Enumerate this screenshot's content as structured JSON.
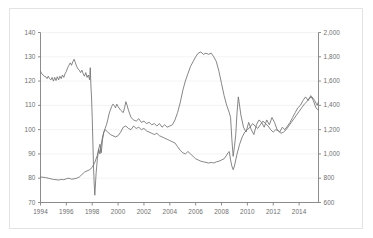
{
  "chart_data": {
    "type": "line",
    "title": "",
    "subtitle": "",
    "xlabel": "",
    "ylabel": "",
    "y2label": "",
    "grid": "horizontal",
    "legend": "none",
    "xlim": [
      1994.0,
      2015.5
    ],
    "ylim": [
      70,
      140
    ],
    "y2lim": [
      600,
      2000
    ],
    "x_tick_labels": [
      "1994",
      "1996",
      "1998",
      "2000",
      "2002",
      "2004",
      "2006",
      "2008",
      "2010",
      "2012",
      "2014"
    ],
    "x_tick_values": [
      1994,
      1996,
      1998,
      2000,
      2002,
      2004,
      2006,
      2008,
      2010,
      2012,
      2014
    ],
    "y_tick_labels": [
      "70",
      "80",
      "90",
      "100",
      "110",
      "120",
      "130",
      "140"
    ],
    "y_tick_values": [
      70,
      80,
      90,
      100,
      110,
      120,
      130,
      140
    ],
    "y2_tick_labels": [
      "600",
      "800",
      "1,000",
      "1,200",
      "1,400",
      "1,600",
      "1,800",
      "2,000"
    ],
    "y2_tick_values": [
      600,
      800,
      1000,
      1200,
      1400,
      1600,
      1800,
      2000
    ],
    "series": [
      {
        "name": "series-left-axis",
        "axis": "left",
        "color": "#707070",
        "x": [
          1994.0,
          1994.1,
          1994.2,
          1994.3,
          1994.4,
          1994.5,
          1994.6,
          1994.7,
          1994.8,
          1994.9,
          1995.0,
          1995.1,
          1995.2,
          1995.3,
          1995.4,
          1995.5,
          1995.6,
          1995.7,
          1995.8,
          1995.9,
          1996.0,
          1996.1,
          1996.2,
          1996.3,
          1996.4,
          1996.5,
          1996.6,
          1996.7,
          1996.8,
          1996.9,
          1997.0,
          1997.1,
          1997.2,
          1997.3,
          1997.4,
          1997.5,
          1997.6,
          1997.7,
          1997.8,
          1997.85,
          1997.9,
          1997.95,
          1998.0,
          1998.05,
          1998.1,
          1998.15,
          1998.2,
          1998.3,
          1998.4,
          1998.5,
          1998.6,
          1998.7,
          1998.8,
          1998.9,
          1999.0,
          1999.1,
          1999.2,
          1999.3,
          1999.4,
          1999.5,
          1999.6,
          1999.7,
          1999.8,
          1999.9,
          2000.0,
          2000.2,
          2000.4,
          2000.5,
          2000.6,
          2000.7,
          2000.8,
          2000.9,
          2001.0,
          2001.2,
          2001.4,
          2001.6,
          2001.8,
          2002.0,
          2002.2,
          2002.4,
          2002.6,
          2002.8,
          2003.0,
          2003.2,
          2003.4,
          2003.6,
          2003.8,
          2004.0,
          2004.2,
          2004.4,
          2004.6,
          2004.8,
          2005.0,
          2005.2,
          2005.4,
          2005.6,
          2005.8,
          2006.0,
          2006.2,
          2006.4,
          2006.6,
          2006.8,
          2007.0,
          2007.2,
          2007.4,
          2007.6,
          2007.8,
          2008.0,
          2008.2,
          2008.4,
          2008.5,
          2008.6,
          2008.7,
          2008.8,
          2008.9,
          2009.0,
          2009.1,
          2009.2,
          2009.3,
          2009.5,
          2009.7,
          2009.9,
          2010.1,
          2010.3,
          2010.5,
          2010.7,
          2010.9,
          2011.1,
          2011.3,
          2011.5,
          2011.7,
          2011.9,
          2012.1,
          2012.3,
          2012.5,
          2012.7,
          2012.9,
          2013.1,
          2013.3,
          2013.5,
          2013.7,
          2013.9,
          2014.1,
          2014.3,
          2014.5,
          2014.7,
          2014.9,
          2015.1,
          2015.3,
          2015.5
        ],
        "y": [
          124.0,
          123.0,
          122.5,
          122.0,
          121.8,
          121.0,
          122.0,
          121.0,
          120.5,
          121.5,
          120.0,
          121.5,
          120.2,
          121.8,
          120.5,
          122.0,
          121.0,
          122.5,
          121.5,
          123.0,
          124.0,
          125.5,
          126.5,
          127.5,
          126.5,
          128.0,
          129.0,
          127.5,
          126.0,
          125.0,
          124.5,
          123.5,
          124.5,
          123.0,
          122.0,
          123.5,
          121.5,
          122.5,
          120.5,
          125.5,
          118.0,
          113.0,
          105.0,
          95.0,
          85.0,
          78.0,
          73.0,
          82.0,
          88.0,
          92.0,
          90.0,
          94.0,
          97.0,
          99.0,
          100.5,
          102.0,
          104.0,
          106.5,
          108.0,
          109.5,
          110.5,
          110.0,
          109.0,
          110.5,
          109.5,
          108.0,
          107.0,
          109.0,
          111.5,
          110.0,
          108.0,
          106.5,
          105.0,
          104.0,
          103.5,
          104.5,
          103.0,
          103.5,
          102.5,
          103.0,
          102.0,
          102.5,
          101.5,
          102.5,
          101.0,
          102.0,
          101.0,
          101.5,
          102.0,
          104.0,
          107.0,
          111.0,
          116.0,
          120.0,
          123.0,
          126.0,
          128.0,
          130.0,
          131.5,
          132.0,
          131.0,
          131.5,
          131.0,
          131.5,
          130.0,
          128.0,
          124.0,
          119.0,
          114.0,
          110.0,
          108.5,
          107.0,
          105.0,
          96.0,
          89.0,
          93.0,
          98.0,
          107.0,
          113.5,
          106.0,
          101.0,
          99.0,
          103.0,
          100.0,
          98.0,
          102.0,
          104.0,
          103.0,
          101.0,
          104.0,
          102.0,
          105.0,
          103.0,
          100.0,
          99.0,
          101.0,
          100.0,
          101.5,
          103.0,
          105.0,
          107.0,
          109.0,
          110.0,
          112.0,
          113.5,
          112.0,
          114.0,
          112.0,
          109.0,
          108.0
        ]
      },
      {
        "name": "series-right-axis",
        "axis": "right",
        "color": "#707070",
        "x": [
          1994.0,
          1994.2,
          1994.4,
          1994.6,
          1994.8,
          1995.0,
          1995.2,
          1995.4,
          1995.6,
          1995.8,
          1996.0,
          1996.2,
          1996.4,
          1996.6,
          1996.8,
          1997.0,
          1997.2,
          1997.4,
          1997.6,
          1997.8,
          1998.0,
          1998.2,
          1998.4,
          1998.5,
          1998.6,
          1998.7,
          1998.8,
          1998.9,
          1999.0,
          1999.2,
          1999.4,
          1999.6,
          1999.8,
          2000.0,
          2000.2,
          2000.4,
          2000.6,
          2000.8,
          2001.0,
          2001.2,
          2001.4,
          2001.6,
          2001.8,
          2002.0,
          2002.2,
          2002.4,
          2002.6,
          2002.8,
          2003.0,
          2003.2,
          2003.4,
          2003.6,
          2003.8,
          2004.0,
          2004.2,
          2004.4,
          2004.6,
          2004.8,
          2005.0,
          2005.2,
          2005.4,
          2005.6,
          2005.8,
          2006.0,
          2006.2,
          2006.4,
          2006.6,
          2006.8,
          2007.0,
          2007.2,
          2007.4,
          2007.6,
          2007.8,
          2008.0,
          2008.2,
          2008.4,
          2008.5,
          2008.6,
          2008.7,
          2008.8,
          2008.9,
          2009.0,
          2009.2,
          2009.4,
          2009.6,
          2009.8,
          2010.0,
          2010.2,
          2010.4,
          2010.6,
          2010.8,
          2011.0,
          2011.2,
          2011.4,
          2011.6,
          2011.8,
          2012.0,
          2012.2,
          2012.4,
          2012.6,
          2012.8,
          2013.0,
          2013.2,
          2013.4,
          2013.6,
          2013.8,
          2014.0,
          2014.2,
          2014.4,
          2014.6,
          2014.8,
          2015.0,
          2015.2,
          2015.4,
          2015.5
        ],
        "y": [
          810,
          808,
          805,
          800,
          795,
          790,
          788,
          785,
          790,
          788,
          795,
          800,
          792,
          795,
          800,
          810,
          830,
          850,
          860,
          870,
          890,
          930,
          990,
          1040,
          1080,
          1010,
          1120,
          1180,
          1200,
          1180,
          1160,
          1150,
          1140,
          1150,
          1180,
          1220,
          1230,
          1210,
          1200,
          1230,
          1210,
          1220,
          1200,
          1210,
          1190,
          1180,
          1170,
          1160,
          1170,
          1150,
          1140,
          1130,
          1120,
          1110,
          1100,
          1090,
          1060,
          1030,
          1010,
          1000,
          1020,
          1000,
          980,
          960,
          950,
          940,
          935,
          930,
          925,
          930,
          925,
          935,
          940,
          950,
          960,
          990,
          1010,
          1020,
          950,
          900,
          870,
          900,
          1000,
          1080,
          1140,
          1180,
          1200,
          1220,
          1250,
          1230,
          1210,
          1240,
          1270,
          1250,
          1230,
          1200,
          1180,
          1200,
          1190,
          1170,
          1180,
          1200,
          1230,
          1260,
          1290,
          1320,
          1350,
          1380,
          1410,
          1430,
          1460,
          1470,
          1440,
          1400,
          1430
        ]
      }
    ]
  },
  "axes": {
    "left_ticks": [
      "140",
      "130",
      "120",
      "110",
      "100",
      "90",
      "80",
      "70"
    ],
    "right_ticks": [
      "2,000",
      "1,800",
      "1,600",
      "1,400",
      "1,200",
      "1,000",
      "800",
      "600"
    ],
    "x_ticks": [
      "1994",
      "1996",
      "1998",
      "2000",
      "2002",
      "2004",
      "2006",
      "2008",
      "2010",
      "2012",
      "2014"
    ]
  },
  "style": {
    "axis_color": "#808080",
    "grid_color": "#f0f0f0",
    "tick_text_color": "#6e6e6e",
    "frame_color": "#e3e3e3",
    "background": "#ffffff",
    "line_color": "#707070"
  }
}
